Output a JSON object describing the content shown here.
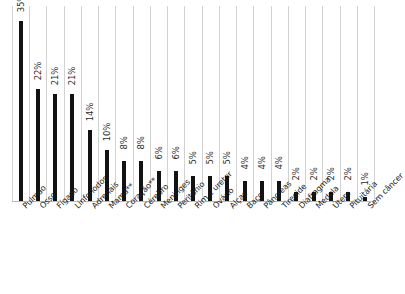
{
  "chart_data": {
    "type": "bar",
    "title": "",
    "subtitle": "",
    "xlabel": "",
    "ylabel": "",
    "ylim": [
      0,
      38
    ],
    "grid": "vertical-category-separators",
    "legend": "none",
    "orientation": "vertical",
    "value_label_suffix": "%",
    "value_label_rotation": "vertical",
    "category_label_rotation": "-45deg",
    "categories": [
      "Pulmão",
      "Osso",
      "Fígado",
      "Linfonodos",
      "Adrenais",
      "Mama**",
      "Coração**",
      "Cérebro",
      "Meninges",
      "Peritônio",
      "Rim e ureter",
      "Ovário",
      "Alças",
      "Baço",
      "Pâncreas",
      "Tireoide",
      "Diafragma",
      "Medula",
      "Útero",
      "Pituitária",
      "Sem câncer"
    ],
    "values": [
      35,
      22,
      21,
      21,
      14,
      10,
      8,
      8,
      6,
      6,
      5,
      5,
      5,
      4,
      4,
      4,
      2,
      2,
      2,
      2,
      1
    ],
    "value_labels": [
      "35%",
      "22%",
      "21%",
      "21%",
      "14%",
      "10%",
      "8%",
      "8%",
      "6%",
      "6%",
      "5%",
      "5%",
      "5%",
      "4%",
      "4%",
      "4%",
      "2%",
      "2%",
      "2%",
      "2%",
      "1%"
    ],
    "colors": {
      "bar": "#121212",
      "gridline": "#d2d2d2",
      "text": "#1c1c1c",
      "value_text": "#2b2b2b",
      "background": "#ffffff"
    }
  }
}
